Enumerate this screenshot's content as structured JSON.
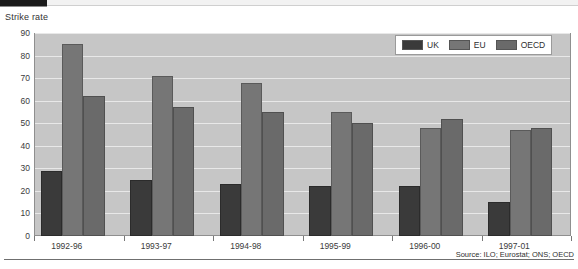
{
  "chart_data": {
    "type": "bar",
    "title": "Strike rate",
    "xlabel": "",
    "ylabel": "",
    "ylim": [
      0,
      90
    ],
    "yticks": [
      0,
      10,
      20,
      30,
      40,
      50,
      60,
      70,
      80,
      90
    ],
    "grid": true,
    "legend_position": "top-right",
    "categories": [
      "1992-96",
      "1993-97",
      "1994-98",
      "1995-99",
      "1996-00",
      "1997-01"
    ],
    "series": [
      {
        "name": "UK",
        "color": "#3a3a3a",
        "values": [
          29,
          25,
          23,
          22,
          22,
          15
        ]
      },
      {
        "name": "EU",
        "color": "#767676",
        "values": [
          85,
          71,
          68,
          55,
          48,
          47
        ]
      },
      {
        "name": "OECD",
        "color": "#6a6a6a",
        "values": [
          62,
          57,
          55,
          50,
          52,
          48
        ]
      }
    ],
    "source": "Source: ILO; Eurostat; ONS; OECD"
  },
  "legend": {
    "items": [
      {
        "label": "UK"
      },
      {
        "label": "EU"
      },
      {
        "label": "OECD"
      }
    ]
  },
  "footer": {
    "source_text": "Source: ILO; Eurostat; ONS; OECD"
  }
}
